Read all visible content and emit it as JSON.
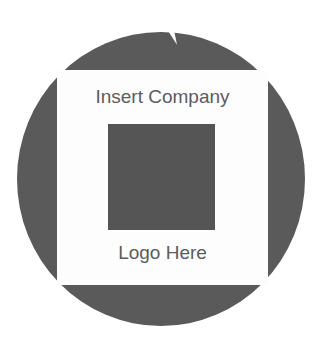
{
  "badge": {
    "title_line": "Insert Company",
    "subtitle_line": "Logo Here",
    "colors": {
      "circle": "#5a5a5a",
      "panel": "#fdfdfd",
      "logo_placeholder": "#555555",
      "text": "#5c5c5c"
    }
  }
}
